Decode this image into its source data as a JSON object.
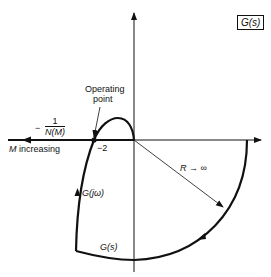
{
  "title_box": "G(s)",
  "labels": {
    "operating_point_line1": "Operating",
    "operating_point_line2": "point",
    "neg_sign": "−",
    "describing_fn_num": "1",
    "describing_fn_den": "N(M)",
    "m_increasing_var": "M",
    "m_increasing_text": "increasing",
    "critical_value": "−2",
    "radius_label": "R → ∞",
    "g_jw": "G(jω)",
    "g_s": "G(s)"
  },
  "colors": {
    "ink": "#111111",
    "background": "#ffffff"
  }
}
